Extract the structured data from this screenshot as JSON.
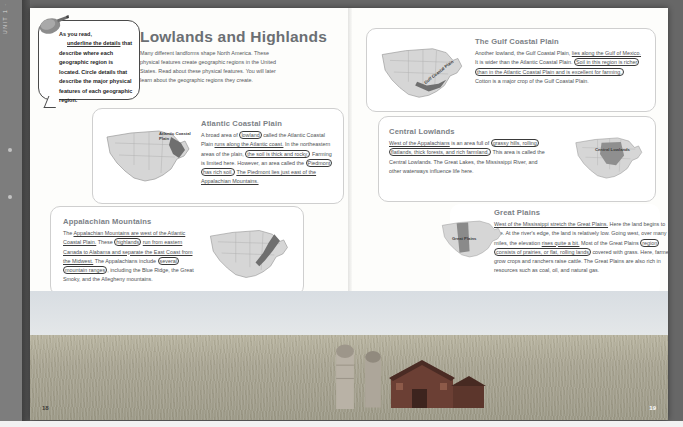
{
  "rail": {
    "vertical_text": "UNIT 1 · GEOGRAPHY"
  },
  "book": {
    "headline": "Lowlands and Highlands",
    "intro": "Many different landforms shape North America. These physical features create geographic regions in the United States. Read about these physical features. You will later learn about the geographic regions they create.",
    "page_left": "18",
    "page_right": "19"
  },
  "callout": {
    "icon": "pencil-icon",
    "line1": "As you read,",
    "line2": "underline the details",
    "line3": "that describe where",
    "line4": "each geographic region",
    "line5": "is located. Circle details",
    "line6": "that describe the major",
    "line7": "physical features of",
    "line8": "each geographic region."
  },
  "sections": [
    {
      "id": "atlantic-coastal-plain",
      "title": "Atlantic Coastal Plain",
      "map_label": "Atlantic Coastal Plain",
      "body": [
        {
          "t": "A broad area of ",
          "m": "none"
        },
        {
          "t": "lowland",
          "m": "circle"
        },
        {
          "t": " called the Atlantic Coastal Plain ",
          "m": "none"
        },
        {
          "t": "runs along the Atlantic coast.",
          "m": "underline"
        },
        {
          "t": " In the northeastern areas of the plain, ",
          "m": "none"
        },
        {
          "t": "the soil is thick and rocky.",
          "m": "circle"
        },
        {
          "t": " Farming is limited here. However, an area called the ",
          "m": "none"
        },
        {
          "t": "Piedmont has rich soil.",
          "m": "circle"
        },
        {
          "t": " ",
          "m": "none"
        },
        {
          "t": "The Piedmont lies just east of the Appalachian Mountains.",
          "m": "underline"
        }
      ]
    },
    {
      "id": "appalachian-mountains",
      "title": "Appalachian Mountains",
      "map_label": "Appalachian Mountains",
      "body": [
        {
          "t": "The ",
          "m": "none"
        },
        {
          "t": "Appalachian Mountains are west of the Atlantic Coastal Plain.",
          "m": "underline"
        },
        {
          "t": " These ",
          "m": "none"
        },
        {
          "t": "highlands",
          "m": "circle"
        },
        {
          "t": " ",
          "m": "none"
        },
        {
          "t": "run from eastern Canada to Alabama and separate the East Coast from the Midwest.",
          "m": "underline"
        },
        {
          "t": " The Appalachians include ",
          "m": "none"
        },
        {
          "t": "several mountain ranges",
          "m": "circle"
        },
        {
          "t": ", including the Blue Ridge, the Great Smoky, and the Allegheny mountains.",
          "m": "none"
        }
      ]
    },
    {
      "id": "gulf-coastal-plain",
      "title": "The Gulf Coastal Plain",
      "map_label": "Gulf Coastal Plain",
      "body": [
        {
          "t": "Another lowland, the Gulf Coastal Plain, ",
          "m": "none"
        },
        {
          "t": "lies along the Gulf of Mexico.",
          "m": "underline"
        },
        {
          "t": " It is wider than the Atlantic Coastal Plain. ",
          "m": "none"
        },
        {
          "t": "Soil in this region is richer than in the Atlantic Coastal Plain and is excellent for farming.",
          "m": "circle"
        },
        {
          "t": " Cotton is a major crop of the Gulf Coastal Plain.",
          "m": "none"
        }
      ]
    },
    {
      "id": "central-lowlands",
      "title": "Central Lowlands",
      "map_label": "Central Lowlands",
      "body": [
        {
          "t": "West of the Appalachians",
          "m": "underline"
        },
        {
          "t": " is an area full of ",
          "m": "none"
        },
        {
          "t": "grassy hills, rolling flatlands, thick forests, and rich farmland.",
          "m": "circle"
        },
        {
          "t": " This area is called the Central Lowlands. The Great Lakes, the Mississippi River, and other waterways influence life here.",
          "m": "none"
        }
      ]
    },
    {
      "id": "great-plains",
      "title": "Great Plains",
      "map_label": "Great Plains",
      "body": [
        {
          "t": "West of the Mississippi stretch the Great Plains.",
          "m": "underline"
        },
        {
          "t": " Here the land begins to rise. At the river's edge, the land is relatively low. Going west, over many miles, the elevation ",
          "m": "none"
        },
        {
          "t": "rises quite a bit.",
          "m": "underline"
        },
        {
          "t": " Most of the Great Plains ",
          "m": "none"
        },
        {
          "t": "region consists of prairies, or flat, rolling lands",
          "m": "circle"
        },
        {
          "t": " covered with grass. Here, farmers grow crops and ranchers raise cattle. The Great Plains are also rich in resources such as coal, oil, and natural gas.",
          "m": "none"
        }
      ]
    }
  ]
}
